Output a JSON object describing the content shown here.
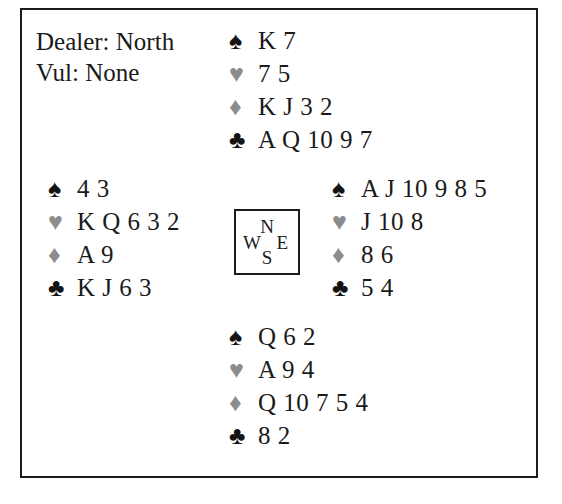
{
  "board": {
    "dealer_line": "Dealer: North",
    "vulnerability_line": "Vul: None"
  },
  "suit_glyphs": {
    "spade": "♠",
    "heart": "♥",
    "diamond": "♦",
    "club": "♣"
  },
  "suit_colors": {
    "black": "#131313",
    "gray": "#8c8c8c"
  },
  "compass": {
    "north": "N",
    "south": "S",
    "west": "W",
    "east": "E"
  },
  "hands": {
    "north": {
      "label": "North",
      "spades": "K 7",
      "hearts": "7 5",
      "diamonds": "K J 3 2",
      "clubs": "A Q 10 9 7"
    },
    "west": {
      "label": "West",
      "spades": "4 3",
      "hearts": "K Q 6 3 2",
      "diamonds": "A 9",
      "clubs": "K J 6 3"
    },
    "east": {
      "label": "East",
      "spades": "A J 10 9 8 5",
      "hearts": "J 10 8",
      "diamonds": "8 6",
      "clubs": "5 4"
    },
    "south": {
      "label": "South",
      "spades": "Q 6 2",
      "hearts": "A 9 4",
      "diamonds": "Q 10 7 5 4",
      "clubs": "8 2"
    }
  }
}
